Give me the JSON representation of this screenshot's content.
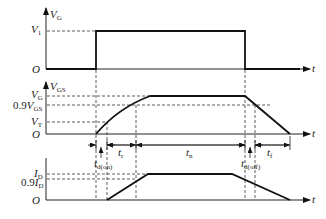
{
  "diagram": {
    "panels": [
      {
        "id": "gate-drive",
        "y_label": {
          "main": "V",
          "sub": "G"
        },
        "levels": [
          {
            "main": "V",
            "sub": "1",
            "prefix": ""
          }
        ],
        "origin": "O",
        "x_label": "t"
      },
      {
        "id": "gate-source",
        "y_label": {
          "main": "V",
          "sub": "GS"
        },
        "levels": [
          {
            "main": "V",
            "sub": "G",
            "prefix": ""
          },
          {
            "main": "V",
            "sub": "GS",
            "prefix": "0.9"
          },
          {
            "main": "V",
            "sub": "T",
            "prefix": ""
          }
        ],
        "origin": "O",
        "x_label": "t"
      },
      {
        "id": "drain-current",
        "y_label": {
          "main": "",
          "sub": ""
        },
        "levels": [
          {
            "main": "I",
            "sub": "D",
            "prefix": ""
          },
          {
            "main": "I",
            "sub": "D",
            "prefix": "0.9"
          }
        ],
        "origin": "O",
        "x_label": "t"
      }
    ],
    "intervals": [
      {
        "main": "t",
        "sub": "d(on)"
      },
      {
        "main": "t",
        "sub": "r"
      },
      {
        "main": "t",
        "sub": "n"
      },
      {
        "main": "t",
        "sub": "d(off)"
      },
      {
        "main": "t",
        "sub": "f"
      }
    ],
    "colors": {
      "line": "#111111",
      "background": "#ffffff"
    }
  }
}
